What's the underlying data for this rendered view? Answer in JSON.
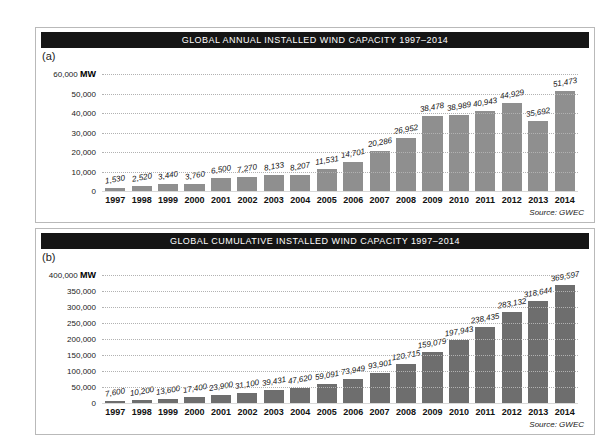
{
  "chart_data": [
    {
      "type": "bar",
      "panel_label": "(a)",
      "title": "GLOBAL ANNUAL INSTALLED WIND CAPACITY 1997–2014",
      "unit": "MW",
      "categories": [
        "1997",
        "1998",
        "1999",
        "2000",
        "2001",
        "2002",
        "2003",
        "2004",
        "2005",
        "2006",
        "2007",
        "2008",
        "2009",
        "2010",
        "2011",
        "2012",
        "2013",
        "2014"
      ],
      "values": [
        1530,
        2520,
        3440,
        3760,
        6500,
        7270,
        8133,
        8207,
        11531,
        14701,
        20286,
        26952,
        38478,
        38989,
        40943,
        44929,
        35692,
        51473
      ],
      "ylim": [
        0,
        60000
      ],
      "ytick": 10000,
      "ylabel": "MW",
      "xlabel": "",
      "grid": true,
      "legend": "none",
      "bar_color": "#8f8f8f",
      "source": "Source: GWEC"
    },
    {
      "type": "bar",
      "panel_label": "(b)",
      "title": "GLOBAL CUMULATIVE INSTALLED WIND CAPACITY 1997–2014",
      "unit": "MW",
      "categories": [
        "1997",
        "1998",
        "1999",
        "2000",
        "2001",
        "2002",
        "2003",
        "2004",
        "2005",
        "2006",
        "2007",
        "2008",
        "2009",
        "2010",
        "2011",
        "2012",
        "2013",
        "2014"
      ],
      "values": [
        7600,
        10200,
        13600,
        17400,
        23900,
        31100,
        39431,
        47620,
        59091,
        73949,
        93901,
        120715,
        159079,
        197943,
        238435,
        283132,
        318644,
        369597
      ],
      "ylim": [
        0,
        400000
      ],
      "ytick": 50000,
      "ylabel": "MW",
      "xlabel": "",
      "grid": true,
      "legend": "none",
      "bar_color": "#6e6e6e",
      "source": "Source: GWEC"
    }
  ],
  "colors": {
    "banner_bg": "#151515",
    "banner_text": "#ffffff",
    "bar_a": "#8f8f8f",
    "bar_b": "#6e6e6e",
    "gridline": "#b2b2b2"
  }
}
